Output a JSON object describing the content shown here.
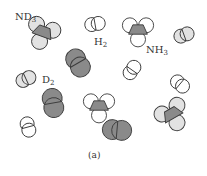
{
  "figure": {
    "caption": "(a)",
    "colors": {
      "hydrogen": "#ffffff",
      "deuterium": "#e2e2e2",
      "nitrogen": "#8a8a8a",
      "outline": "#3a3a3a"
    },
    "labels": {
      "nd3": {
        "text": "ND",
        "sub": "3"
      },
      "h2": {
        "text": "H",
        "sub": "2"
      },
      "nh3": {
        "text": "NH",
        "sub": "3"
      },
      "d2": {
        "text": "D",
        "sub": "2"
      }
    },
    "molecules": [
      {
        "species": "ND3",
        "kind": "triatomic-hydride",
        "atom": "deuterium"
      },
      {
        "species": "H2",
        "kind": "diatomic",
        "atom": "hydrogen"
      },
      {
        "species": "NH3",
        "kind": "triatomic-hydride",
        "atom": "hydrogen"
      },
      {
        "species": "D2",
        "kind": "diatomic",
        "atom": "deuterium"
      },
      {
        "species": "N2",
        "kind": "diatomic",
        "atom": "nitrogen"
      },
      {
        "species": "H2",
        "kind": "diatomic",
        "atom": "hydrogen"
      },
      {
        "species": "D2",
        "kind": "diatomic",
        "atom": "deuterium"
      },
      {
        "species": "H2",
        "kind": "diatomic",
        "atom": "hydrogen"
      },
      {
        "species": "N2",
        "kind": "diatomic",
        "atom": "nitrogen"
      },
      {
        "species": "NH3",
        "kind": "triatomic-hydride",
        "atom": "hydrogen"
      },
      {
        "species": "H2",
        "kind": "diatomic",
        "atom": "hydrogen"
      },
      {
        "species": "N2",
        "kind": "diatomic",
        "atom": "nitrogen"
      },
      {
        "species": "ND3",
        "kind": "triatomic-hydride",
        "atom": "deuterium"
      }
    ]
  }
}
